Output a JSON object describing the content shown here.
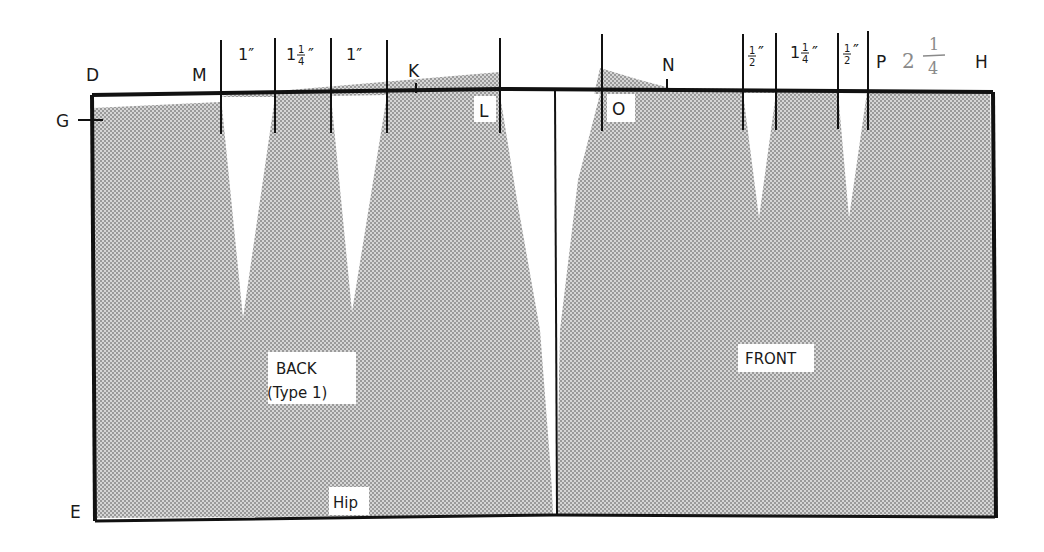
{
  "diagram": {
    "points": {
      "D": "D",
      "G": "G",
      "E": "E",
      "M": "M",
      "K": "K",
      "L": "L",
      "O": "O",
      "N": "N",
      "P": "P",
      "H": "H"
    },
    "back_measurements": {
      "m1": "1″",
      "m2_whole": "1",
      "m2_num": "1",
      "m2_den": "4",
      "m2_mark": "″",
      "m3": "1″"
    },
    "front_measurements": {
      "m1_num": "1",
      "m1_den": "2",
      "m1_mark": "″",
      "m2_whole": "1",
      "m2_num": "1",
      "m2_den": "4",
      "m2_mark": "″",
      "m3_num": "1",
      "m3_den": "2",
      "m3_mark": "″"
    },
    "handwritten_note": {
      "whole": "2",
      "num": "1",
      "den": "4"
    },
    "pieces": {
      "back_line1": "BACK",
      "back_line2": "(Type 1)",
      "front": "FRONT",
      "hip": "Hip"
    },
    "colors": {
      "outline": "#111111",
      "shading": "#b8b8b8",
      "dart": "#ffffff",
      "handwriting": "#8a8a8a"
    }
  }
}
